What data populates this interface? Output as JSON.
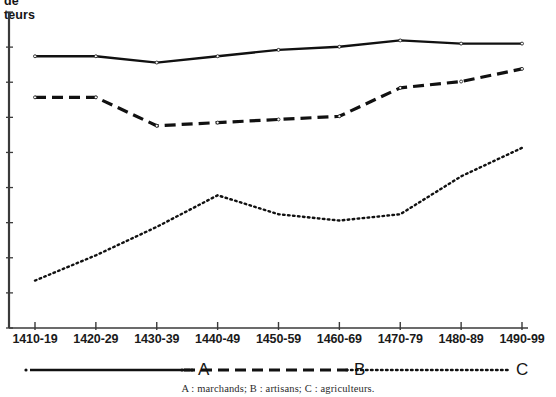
{
  "axis": {
    "y_label_line1": "de",
    "y_label_line2": "teurs",
    "y_label_note": "cropped-at-top"
  },
  "caption": "A : marchands; B : artisans; C : agriculteurs.",
  "legend": {
    "items": [
      {
        "key": "A",
        "label": "A",
        "style": "solid"
      },
      {
        "key": "B",
        "label": "B",
        "style": "dashed"
      },
      {
        "key": "C",
        "label": "C",
        "style": "dotted"
      }
    ]
  },
  "chart_data": {
    "type": "line",
    "title": "",
    "subtitle": "",
    "xlabel": "",
    "ylabel": "de teurs",
    "grid": false,
    "legend_position": "bottom",
    "categories": [
      "1410-19",
      "1420-29",
      "1430-39",
      "1440-49",
      "1450-59",
      "1460-69",
      "1470-79",
      "1480-89",
      "1490-99"
    ],
    "ylim": [
      0,
      100
    ],
    "yticks_labeled": false,
    "series": [
      {
        "name": "A",
        "description": "marchands",
        "style": "solid",
        "values": [
          86,
          86,
          84,
          86,
          88,
          89,
          91,
          90,
          90
        ]
      },
      {
        "name": "B",
        "description": "artisans",
        "style": "dashed",
        "values": [
          73,
          73,
          64,
          65,
          66,
          67,
          76,
          78,
          82
        ]
      },
      {
        "name": "C",
        "description": "agriculteurs",
        "style": "dotted",
        "values": [
          15,
          23,
          32,
          42,
          36,
          34,
          36,
          48,
          57
        ]
      }
    ]
  }
}
